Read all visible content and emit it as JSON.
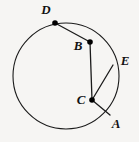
{
  "figure": {
    "background_color": "#f6f5f3",
    "stroke_color": "#1b1b1b",
    "label_color": "#121212"
  },
  "circle": {
    "name": "main-circle",
    "center_x": 66,
    "center_y": 76,
    "radius": 53
  },
  "points": [
    {
      "id": "D",
      "label": "D",
      "x": 55,
      "y": 23,
      "label_x": 46,
      "label_y": 11,
      "has_dot": true,
      "on_circle": true
    },
    {
      "id": "B",
      "label": "B",
      "x": 90,
      "y": 42,
      "label_x": 78,
      "label_y": 47,
      "has_dot": true,
      "on_circle": false
    },
    {
      "id": "E",
      "label": "E",
      "x": 113,
      "y": 65,
      "label_x": 125,
      "label_y": 62,
      "has_dot": false,
      "on_circle": true
    },
    {
      "id": "C",
      "label": "C",
      "x": 92,
      "y": 100,
      "label_x": 81,
      "label_y": 101,
      "has_dot": true,
      "on_circle": false
    },
    {
      "id": "A",
      "label": "A",
      "x": 110,
      "y": 115,
      "label_x": 116,
      "label_y": 125,
      "has_dot": false,
      "on_circle": true
    }
  ],
  "segments": [
    {
      "id": "DB",
      "from": "D",
      "to": "B",
      "x1": 55,
      "y1": 23,
      "x2": 90,
      "y2": 42
    },
    {
      "id": "BC",
      "from": "B",
      "to": "C",
      "x1": 90,
      "y1": 42,
      "x2": 92,
      "y2": 100
    },
    {
      "id": "CE",
      "from": "C",
      "to": "E",
      "x1": 92,
      "y1": 100,
      "x2": 113,
      "y2": 65
    },
    {
      "id": "CA",
      "from": "C",
      "to": "A",
      "x1": 92,
      "y1": 100,
      "x2": 110,
      "y2": 115
    }
  ]
}
